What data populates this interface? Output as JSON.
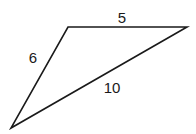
{
  "diagram": {
    "type": "triangle",
    "vertices": {
      "top_left": [
        68,
        27
      ],
      "top_right": [
        187,
        27
      ],
      "bottom_left": [
        11,
        128
      ]
    },
    "sides": [
      {
        "name": "top",
        "label": "5",
        "label_pos": [
          122,
          23
        ]
      },
      {
        "name": "left",
        "label": "6",
        "label_pos": [
          33,
          62
        ]
      },
      {
        "name": "hypotenuse",
        "label": "10",
        "label_pos": [
          112,
          92
        ]
      }
    ],
    "stroke_color": "#1a1a1a",
    "background": "#ffffff"
  }
}
